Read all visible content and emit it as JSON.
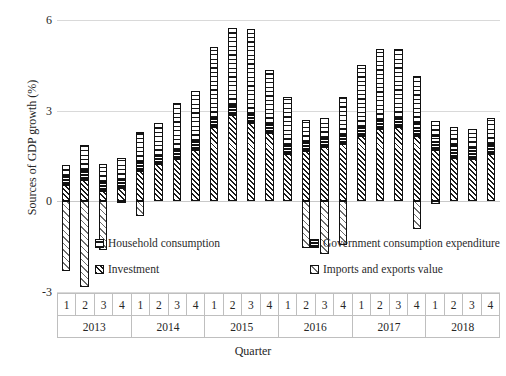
{
  "chart_data": {
    "type": "bar",
    "subtype": "stacked-bar",
    "title": "",
    "xlabel": "Quarter",
    "ylabel": "Sources of GDP growth (%)",
    "ylim": [
      -3,
      6
    ],
    "yticks": [
      6,
      3,
      0,
      -3
    ],
    "ytick_labels": [
      "6",
      "3",
      "0",
      "-3"
    ],
    "grid": true,
    "legend_position": "inside-bottom",
    "years": [
      "2013",
      "2014",
      "2015",
      "2016",
      "2017",
      "2018"
    ],
    "quarters_per_year": [
      "1",
      "2",
      "3",
      "4"
    ],
    "categories": [
      "2013Q1",
      "2013Q2",
      "2013Q3",
      "2013Q4",
      "2014Q1",
      "2014Q2",
      "2014Q3",
      "2014Q4",
      "2015Q1",
      "2015Q2",
      "2015Q3",
      "2015Q4",
      "2016Q1",
      "2016Q2",
      "2016Q3",
      "2016Q4",
      "2017Q1",
      "2017Q2",
      "2017Q3",
      "2017Q4",
      "2018Q1",
      "2018Q2",
      "2018Q3",
      "2018Q4"
    ],
    "series": [
      {
        "name": "Investment",
        "key": "investment",
        "pattern": "diagonal-hatch-dense",
        "values": [
          0.55,
          0.7,
          0.35,
          0.45,
          1.0,
          1.25,
          1.4,
          1.7,
          2.45,
          2.85,
          2.6,
          2.25,
          1.55,
          1.65,
          1.8,
          1.9,
          2.15,
          2.4,
          2.45,
          2.15,
          1.7,
          1.45,
          1.4,
          1.55
        ]
      },
      {
        "name": "Government consumption expenditure",
        "key": "government",
        "pattern": "horizontal-bands",
        "values": [
          0.3,
          0.35,
          0.3,
          0.25,
          0.3,
          0.25,
          0.3,
          0.3,
          0.3,
          0.35,
          0.3,
          0.3,
          0.3,
          0.3,
          0.3,
          0.3,
          0.3,
          0.3,
          0.3,
          0.45,
          0.45,
          0.4,
          0.35,
          0.35
        ]
      },
      {
        "name": "Household consumption",
        "key": "household",
        "pattern": "vertical-dashes",
        "values": [
          0.35,
          0.8,
          0.6,
          0.75,
          1.0,
          1.1,
          1.55,
          1.65,
          2.35,
          2.55,
          2.8,
          1.8,
          1.6,
          0.75,
          0.65,
          1.25,
          2.05,
          2.35,
          2.3,
          1.55,
          0.5,
          0.6,
          0.65,
          0.85
        ]
      },
      {
        "name": "Imports and exports value",
        "key": "imports",
        "pattern": "diagonal-hatch-light",
        "values": [
          -2.3,
          -2.85,
          -1.6,
          -0.05,
          -0.5,
          0.0,
          0.0,
          0.0,
          0.0,
          0.0,
          0.0,
          0.0,
          0.0,
          -1.55,
          -1.75,
          -1.45,
          0.0,
          0.0,
          0.0,
          -0.9,
          -0.1,
          0.0,
          0.0,
          0.0
        ]
      }
    ],
    "totals": [
      1.2,
      1.85,
      1.25,
      1.45,
      2.3,
      2.6,
      3.25,
      3.65,
      5.1,
      5.75,
      5.7,
      4.35,
      3.45,
      2.7,
      2.75,
      3.45,
      4.5,
      5.05,
      5.05,
      4.15,
      2.55,
      2.45,
      2.4,
      2.75
    ]
  },
  "axis": {
    "y_title": "Sources of GDP growth (%)",
    "x_title": "Quarter",
    "y_labels": [
      "6",
      "3",
      "0",
      "-3"
    ]
  },
  "legend": {
    "items": [
      {
        "label": "Household consumption",
        "key": "household"
      },
      {
        "label": "Government consumption expenditure",
        "key": "government"
      },
      {
        "label": "Investment",
        "key": "investment"
      },
      {
        "label": "Imports and exports value",
        "key": "imports"
      }
    ]
  },
  "colors": {
    "ink": "#111111",
    "grid": "#d9d9d9",
    "axis_text": "#262626",
    "background": "#ffffff"
  }
}
